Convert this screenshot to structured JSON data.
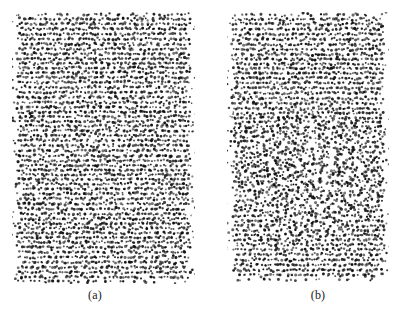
{
  "figure": {
    "background_color": "#ffffff",
    "particle_color": "#111111",
    "width": 407,
    "height": 312,
    "panels": [
      {
        "id": "panel-a",
        "caption": "(a)",
        "x": 12,
        "y": 12,
        "width": 183,
        "height": 272,
        "description": "ordered layered crystal",
        "n_layers": 56,
        "layer_spacing": 4.85,
        "particles_per_layer": 68,
        "particle_radius": 1.15,
        "jitter_x": 1.05,
        "jitter_y": 0.72,
        "edge_fuzz": 7,
        "stray_count": 70,
        "disorder_patch": null
      },
      {
        "id": "panel-b",
        "caption": "(b)",
        "x": 227,
        "y": 12,
        "width": 162,
        "height": 270,
        "description": "layered crystal with central melted disordered region",
        "n_layers": 55,
        "layer_spacing": 4.9,
        "particles_per_layer": 60,
        "particle_radius": 1.15,
        "jitter_x": 1.05,
        "jitter_y": 0.72,
        "edge_fuzz": 7,
        "stray_count": 60,
        "disorder_patch": {
          "cx": 0.5,
          "cy": 0.6,
          "rx": 0.46,
          "ry": 0.24,
          "amplitude": 2.9
        }
      }
    ]
  },
  "chart_data": {
    "type": "scatter",
    "title": "",
    "xlabel": "",
    "ylabel": "",
    "grid": false,
    "legend": null,
    "annotations": [
      "(a)",
      "(b)"
    ],
    "series": [
      {
        "name": "(a) ordered crystalline configuration",
        "n_points": 3808,
        "layout": "horizontal layers",
        "layers": 56,
        "points_per_layer": 68,
        "layer_spacing_px": 4.85,
        "xlim": [
          0,
          183
        ],
        "ylim": [
          0,
          272
        ],
        "marker": "dot",
        "marker_size": 1.15,
        "color": "#111111"
      },
      {
        "name": "(b) partially melted configuration",
        "n_points": 3300,
        "layout": "horizontal layers with disordered central region",
        "layers": 55,
        "points_per_layer": 60,
        "layer_spacing_px": 4.9,
        "xlim": [
          0,
          162
        ],
        "ylim": [
          0,
          270
        ],
        "marker": "dot",
        "marker_size": 1.15,
        "color": "#111111",
        "disordered_region": {
          "center_x_frac": 0.5,
          "center_y_frac": 0.6,
          "radius_x_frac": 0.46,
          "radius_y_frac": 0.24
        }
      }
    ]
  }
}
